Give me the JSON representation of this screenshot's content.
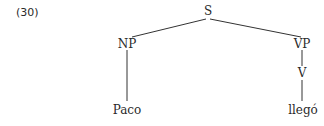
{
  "example_number": "(30)",
  "tree": {
    "root": {
      "label": "S",
      "children": [
        {
          "label": "NP",
          "children": [
            {
              "label": "Paco"
            }
          ]
        },
        {
          "label": "VP",
          "children": [
            {
              "label": "V",
              "children": [
                {
                  "label": "llegó"
                }
              ]
            }
          ]
        }
      ]
    }
  },
  "nodes": {
    "s": "S",
    "np": "NP",
    "vp": "VP",
    "v": "V",
    "paco": "Paco",
    "llego": "llegó"
  },
  "colors": {
    "ink": "#2a2a2a",
    "lines": "#333333",
    "background": "#ffffff"
  }
}
